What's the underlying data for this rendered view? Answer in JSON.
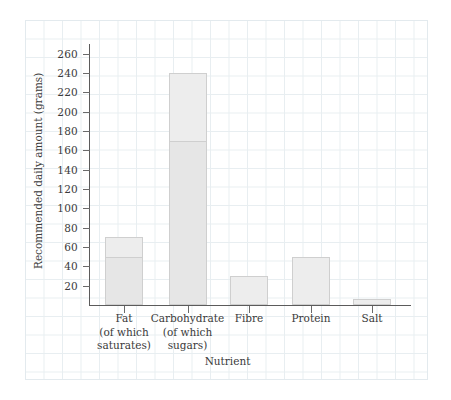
{
  "chart_data": {
    "type": "bar",
    "title": "",
    "subtitle": "",
    "xlabel": "Nutrient",
    "ylabel": "Recommended daily amount (grams)",
    "ylim": [
      0,
      270
    ],
    "ytick_step": 20,
    "yticks": [
      20,
      40,
      60,
      80,
      100,
      120,
      140,
      160,
      180,
      200,
      220,
      240,
      260
    ],
    "ytick_labels": [
      "20",
      "40",
      "60",
      "80",
      "100",
      "120",
      "140",
      "160",
      "180",
      "200",
      "220",
      "240",
      "260"
    ],
    "grid": "graph-paper background, no plot gridlines",
    "legend": "none",
    "stacked_note": "Fat and Carbohydrate bars are subdivided to show the 'of which' component",
    "categories": [
      "Fat (of which saturates)",
      "Carbohydrate (of which sugars)",
      "Fibre",
      "Protein",
      "Salt"
    ],
    "category_lines": [
      [
        "Fat",
        "(of which",
        "saturates)"
      ],
      [
        "Carbohydrate",
        "(of which",
        "sugars)"
      ],
      [
        "Fibre",
        "",
        ""
      ],
      [
        "Protein",
        "",
        ""
      ],
      [
        "Salt",
        "",
        ""
      ]
    ],
    "values": [
      70,
      240,
      30,
      50,
      6
    ],
    "sub_values": [
      50,
      170,
      null,
      null,
      null
    ],
    "series": [
      {
        "name": "Recommended daily amount",
        "values": [
          70,
          240,
          30,
          50,
          6
        ]
      },
      {
        "name": "of which (saturates / sugars)",
        "values": [
          50,
          170,
          null,
          null,
          null
        ]
      }
    ],
    "colors": {
      "bar_fill": "#ededed",
      "bar_sub_fill": "#e6e6e6",
      "bar_border": "#cfcfcf",
      "axis": "#5b5b5b",
      "text": "#3a3a3a",
      "grid_paper": "#e8eef1",
      "background": "#ffffff"
    }
  }
}
